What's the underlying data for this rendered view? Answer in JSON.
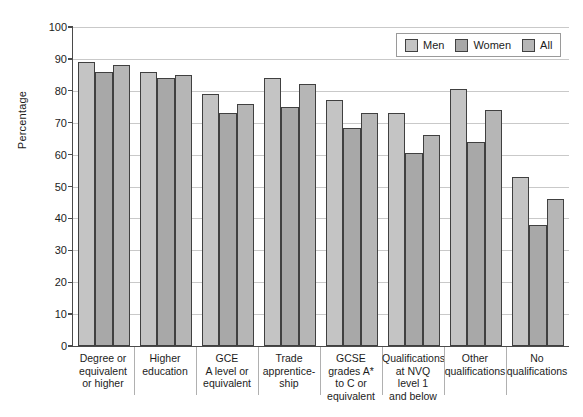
{
  "chart_data": {
    "type": "bar",
    "title": "",
    "xlabel": "",
    "ylabel": "Percentage",
    "ylim": [
      0,
      100
    ],
    "ytick_step": 10,
    "yticks": [
      0,
      10,
      20,
      30,
      40,
      50,
      60,
      70,
      80,
      90,
      100
    ],
    "ytick_labels": [
      "0",
      "10",
      "20",
      "30",
      "40",
      "50",
      "60",
      "70",
      "80",
      "90",
      "100"
    ],
    "grid": true,
    "legend_position": "top-right",
    "categories": [
      "Degree or\nequivalent\nor higher",
      "Higher\neducation",
      "GCE\nA level or\nequivalent",
      "Trade\napprentice-\nship",
      "GCSE\ngrades A*\nto C or\nequivalent",
      "Qualifications\nat NVQ\nlevel 1\nand below",
      "Other\nqualifications",
      "No\nqualifications"
    ],
    "series": [
      {
        "name": "Men",
        "color": "#c4c4c4",
        "values": [
          89,
          86,
          79,
          84,
          77,
          73,
          80.5,
          53
        ]
      },
      {
        "name": "Women",
        "color": "#a8a8a8",
        "values": [
          86,
          84,
          73,
          75,
          68.5,
          60.5,
          64,
          38
        ]
      },
      {
        "name": "All",
        "color": "#b6b6b6",
        "values": [
          88,
          85,
          76,
          82,
          73,
          66,
          74,
          46
        ]
      }
    ]
  },
  "legend": {
    "items": [
      {
        "label": "Men"
      },
      {
        "label": "Women"
      },
      {
        "label": "All"
      }
    ]
  },
  "axis": {
    "y_title": "Percentage"
  }
}
